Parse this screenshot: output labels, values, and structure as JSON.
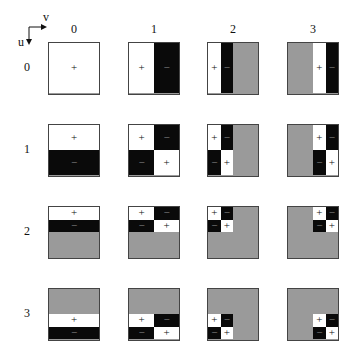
{
  "axes": {
    "u_label": "u",
    "v_label": "v"
  },
  "col_labels": [
    "0",
    "1",
    "2",
    "3"
  ],
  "row_labels": [
    "0",
    "1",
    "2",
    "3"
  ],
  "colors": {
    "positive": "#ffffff",
    "negative": "#0a0a0a",
    "zero": "#9a9a9a",
    "border": "#444444"
  },
  "signs": {
    "positive": "+",
    "negative": "−"
  },
  "grid_layout": {
    "col_x": [
      48,
      128,
      207,
      287
    ],
    "row_y": [
      42,
      124,
      206,
      288
    ],
    "cell_size": 52
  },
  "basis_1d": [
    [
      1,
      1,
      1,
      1
    ],
    [
      1,
      1,
      -1,
      -1
    ],
    [
      1,
      -1,
      0,
      0
    ],
    [
      0,
      0,
      1,
      -1
    ]
  ]
}
